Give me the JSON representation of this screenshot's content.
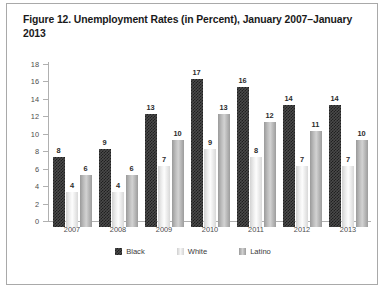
{
  "figure": {
    "title": "Figure 12. Unemployment Rates (in Percent), January 2007–January 2013",
    "border_color": "#a9a9a9"
  },
  "legend": {
    "position": "bottom-center",
    "items": [
      {
        "label": "Black",
        "swatch": "black-hatch-swatch",
        "color": "#4a4a4a"
      },
      {
        "label": "White",
        "swatch": "white-gradient-swatch",
        "color": "#e8e8e8"
      },
      {
        "label": "Latino",
        "swatch": "latino-gradient-swatch",
        "color": "#b5b5b5"
      }
    ]
  },
  "chart_data": {
    "type": "bar",
    "title": "Figure 12. Unemployment Rates (in Percent), January 2007–January 2013",
    "xlabel": "",
    "ylabel": "",
    "ylim": [
      0,
      18
    ],
    "yticks": [
      0,
      2,
      4,
      6,
      8,
      10,
      12,
      14,
      16,
      18
    ],
    "grid": false,
    "legend_position": "bottom-center",
    "categories": [
      "2007",
      "2008",
      "2009",
      "2010",
      "2011",
      "2012",
      "2013"
    ],
    "series": [
      {
        "name": "Black",
        "values": [
          8,
          9,
          13,
          17,
          16,
          14,
          14
        ]
      },
      {
        "name": "White",
        "values": [
          4,
          4,
          7,
          9,
          8,
          7,
          7
        ]
      },
      {
        "name": "Latino",
        "values": [
          6,
          6,
          10,
          13,
          12,
          11,
          10
        ]
      }
    ]
  }
}
